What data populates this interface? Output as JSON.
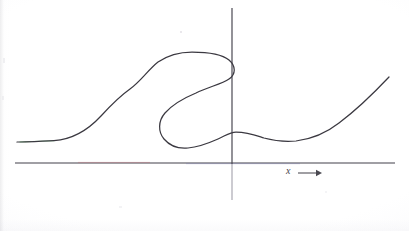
{
  "figure": {
    "kind": "math-graph",
    "background_color": "#ffffff",
    "ink_color": "#3b3941",
    "axis_color": "#43414b",
    "width": 409,
    "height": 231,
    "labels": {
      "x_axis_label": "x",
      "x_axis_arrow": "arrow-right"
    },
    "axes": {
      "x_axis": {
        "y": 163,
        "x_start": 15,
        "x_end": 395
      },
      "y_axis": {
        "x": 232,
        "y_start": 8,
        "y_end": 200,
        "y_below_origin_faint_from": 164
      },
      "origin": {
        "x": 232,
        "y": 163
      }
    },
    "scan_tints": {
      "curve_green_tint": "#7dcf84",
      "axis_red_tint": "#c06a74",
      "axis_blue_tint": "#6f6fae"
    }
  },
  "chart_data": {
    "type": "line",
    "title": "",
    "xlabel": "x",
    "ylabel": "",
    "grid": false,
    "legend": null,
    "axis_ranges": {
      "x_pixel": [
        15,
        395
      ],
      "y_pixel": [
        8,
        200
      ]
    },
    "key_points_pixel": [
      {
        "name": "left-start-flat",
        "x": 17,
        "y": 142
      },
      {
        "name": "left-flat-end",
        "x": 52,
        "y": 141
      },
      {
        "name": "inflection-rise",
        "x": 104,
        "y": 113
      },
      {
        "name": "shoulder",
        "x": 128,
        "y": 92
      },
      {
        "name": "plateau-left",
        "x": 158,
        "y": 58
      },
      {
        "name": "plateau-top",
        "x": 185,
        "y": 53
      },
      {
        "name": "fold-right-turn",
        "x": 232,
        "y": 62
      },
      {
        "name": "fold-return-down",
        "x": 228,
        "y": 80
      },
      {
        "name": "fold-mid-left",
        "x": 196,
        "y": 93
      },
      {
        "name": "lower-lobe-left",
        "x": 163,
        "y": 119
      },
      {
        "name": "lower-lobe-bottom",
        "x": 182,
        "y": 147
      },
      {
        "name": "lower-lobe-right",
        "x": 215,
        "y": 140
      },
      {
        "name": "local-max-right-of-axis",
        "x": 234,
        "y": 132
      },
      {
        "name": "local-min-right",
        "x": 296,
        "y": 141
      },
      {
        "name": "right-rise-mid",
        "x": 345,
        "y": 118
      },
      {
        "name": "right-end",
        "x": 389,
        "y": 77
      }
    ],
    "path_svg_d": "M 17 142 C 30 141.6 42 141.4 54 140.6 C 72 139.4 88 130 101 116 C 112 104 120 96 130 89 C 141 81 148 70 158 62 C 168 55 180 52 192 52 C 208 52 222 54 229 60 C 236 66 236 74 229 79 C 222 84 208 87 196 93 C 184 98 172 105 165 113 C 158 121 158 132 164 139 C 170 146 178 149 188 148 C 200 147 209 143 218 139 C 225 136 230 132 236 132 C 248 132 255 135 264 138 C 275 141 286 142 296 141 C 312 139 325 134 339 123 C 355 111 372 95 389 77"
  },
  "marks": {
    "x_label_position": {
      "left": 286,
      "top": 166
    },
    "arrow": {
      "x_start": 298,
      "x_end": 322,
      "y": 173
    }
  }
}
